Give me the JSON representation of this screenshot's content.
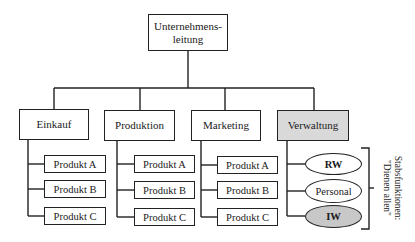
{
  "diagram": {
    "type": "organization-chart",
    "top": {
      "label": "Unternehmens-\nleitung",
      "line1": "Unternehmens-",
      "line2": "leitung"
    },
    "departments": [
      {
        "label": "Einkauf",
        "highlighted": false,
        "children": [
          "Produkt A",
          "Produkt B",
          "Produkt C"
        ]
      },
      {
        "label": "Produktion",
        "highlighted": false,
        "children": [
          "Produkt A",
          "Produkt B",
          "Produkt C"
        ]
      },
      {
        "label": "Marketing",
        "highlighted": false,
        "children": [
          "Produkt A",
          "Produkt B",
          "Produkt C"
        ]
      },
      {
        "label": "Verwaltung",
        "highlighted": true,
        "children": [
          "RW",
          "Personal",
          "IW"
        ]
      }
    ],
    "staff_bracket": {
      "line1": "Stabsfunktionen:",
      "line2": "\"Dienen allen\""
    },
    "colors": {
      "line": "#222222",
      "highlight_fill": "#d9d9d9",
      "iw_fill": "#c8c8c8",
      "background": "#ffffff"
    }
  }
}
